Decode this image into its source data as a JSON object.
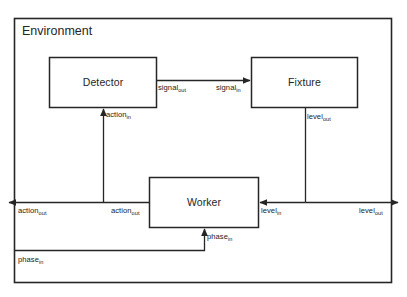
{
  "diagram": {
    "type": "block-diagram",
    "title": "Environment",
    "background_color": "#ffffff",
    "line_color": "#262626",
    "nodes": [
      {
        "id": "environment",
        "label": "Environment",
        "shape": "rectangle",
        "role": "container"
      },
      {
        "id": "detector",
        "label": "Detector",
        "shape": "rectangle"
      },
      {
        "id": "fixture",
        "label": "Fixture",
        "shape": "rectangle"
      },
      {
        "id": "worker",
        "label": "Worker",
        "shape": "rectangle"
      }
    ],
    "edges": [
      {
        "id": "detector-to-fixture",
        "from": "detector",
        "to": "fixture",
        "source_label": "signal",
        "source_sub": "out",
        "target_label": "signal",
        "target_sub": "in"
      },
      {
        "id": "worker-to-detector",
        "from": "worker",
        "to": "detector",
        "target_label": "action",
        "target_sub": "in"
      },
      {
        "id": "fixture-to-worker",
        "from": "fixture",
        "to": "worker",
        "source_label": "level",
        "source_sub": "out",
        "target_label": "level",
        "target_sub": "in"
      },
      {
        "id": "worker-action-out-left",
        "from": "worker",
        "to": "environment-boundary-left",
        "source_label": "action",
        "source_sub": "out",
        "boundary_label": "action",
        "boundary_sub": "out"
      },
      {
        "id": "level-out-right",
        "from": "fixture",
        "to": "environment-boundary-right",
        "boundary_label": "level",
        "boundary_sub": "out"
      },
      {
        "id": "phase-in-to-worker",
        "from": "environment-boundary-left",
        "to": "worker",
        "source_label": "phase",
        "source_sub": "in",
        "target_label": "phase",
        "target_sub": "in"
      }
    ],
    "labels": {
      "signal_out": "signal",
      "signal_out_sub": "out",
      "signal_in": "signal",
      "signal_in_sub": "in",
      "action_in": "action",
      "action_in_sub": "in",
      "action_out_inner": "action",
      "action_out_inner_sub": "out",
      "action_out_boundary": "action",
      "action_out_boundary_sub": "out",
      "level_out_fixture": "level",
      "level_out_fixture_sub": "out",
      "level_in": "level",
      "level_in_sub": "in",
      "level_out_boundary": "level",
      "level_out_boundary_sub": "out",
      "phase_in_worker": "phase",
      "phase_in_worker_sub": "in",
      "phase_in_boundary": "phase",
      "phase_in_boundary_sub": "in"
    }
  }
}
